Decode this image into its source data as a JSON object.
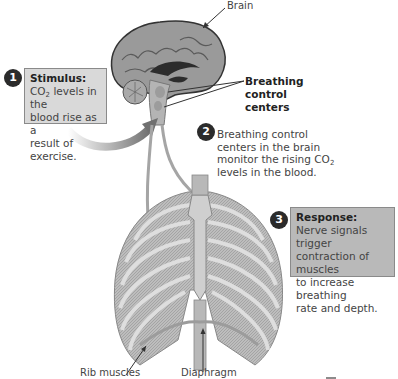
{
  "labels": {
    "brain": "Brain",
    "breathing_control_centers": [
      "Breathing",
      "control",
      "centers"
    ],
    "rib_muscles": "Rib muscles",
    "diaphragm": "Diaphragm"
  },
  "steps": [
    {
      "number": "1",
      "title": "Stimulus:",
      "lines": [
        "CO",
        "2",
        " levels in the",
        "blood rise as a",
        "result of exercise."
      ]
    },
    {
      "number": "2",
      "lines": [
        "Breathing control",
        "centers in the brain",
        "monitor the rising CO",
        "2",
        "levels in the blood."
      ]
    },
    {
      "number": "3",
      "title": "Response:",
      "lines": [
        "Nerve signals trigger",
        "contraction of muscles",
        "to increase breathing",
        "rate and depth."
      ]
    }
  ],
  "colors": {
    "box_fill": "#d9d9d9",
    "badge": "#2b2b2b",
    "arrow": "#6f6f6f",
    "text": "#444444"
  }
}
